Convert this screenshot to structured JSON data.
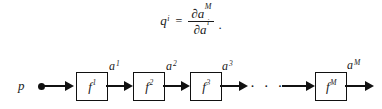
{
  "formula": {
    "lhs_base": "q",
    "lhs_sup": "i",
    "equals": "=",
    "numerator_partial": "∂",
    "numerator_base": "a",
    "numerator_sup": "M",
    "denominator_partial": "∂",
    "denominator_base": "a",
    "denominator_sup": "i",
    "trailing_punctuation": "."
  },
  "diagram": {
    "input_label": "p",
    "ellipsis": "· · ·",
    "blocks": [
      {
        "base": "f",
        "sup": "1"
      },
      {
        "base": "f",
        "sup": "2"
      },
      {
        "base": "f",
        "sup": "3"
      },
      {
        "base": "f",
        "sup": "M"
      }
    ],
    "signals": [
      {
        "base": "a",
        "sup": "1"
      },
      {
        "base": "a",
        "sup": "2"
      },
      {
        "base": "a",
        "sup": "3"
      },
      {
        "base": "a",
        "sup": "M"
      }
    ]
  },
  "colors": {
    "ink": "#111111",
    "background": "#ffffff"
  }
}
